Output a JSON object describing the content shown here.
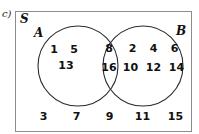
{
  "part_label": "c)",
  "top_artifact": {
    "fragment_left": "",
    "fragment_right": ""
  },
  "labels": {
    "universe": "S",
    "set_a": "A",
    "set_b": "B"
  },
  "colors": {
    "box_border": "#8c8c8c",
    "circle_stroke": "#2b2b2b",
    "text": "#111111",
    "background": "#ffffff"
  },
  "regions": {
    "a_only": {
      "row1": [
        "1",
        "5"
      ],
      "row2": [
        "13"
      ]
    },
    "intersection": {
      "row1": [
        "8"
      ],
      "row2": [
        "16"
      ]
    },
    "b_only": {
      "row1": [
        "2",
        "4",
        "6"
      ],
      "row2": [
        "10",
        "12",
        "14"
      ]
    },
    "outside": [
      "3",
      "7",
      "9",
      "11",
      "15"
    ]
  },
  "geometry": {
    "circle_a": {
      "cx": 78,
      "cy": 66,
      "r": 40
    },
    "circle_b": {
      "cx": 143,
      "cy": 66,
      "r": 40
    }
  }
}
